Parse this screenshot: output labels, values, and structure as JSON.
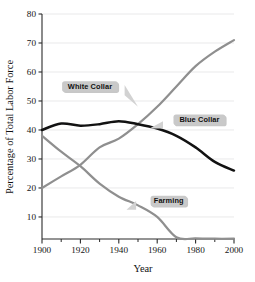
{
  "chart_data": {
    "type": "line",
    "title": "",
    "xlabel": "Year",
    "ylabel": "Percentage of Total Labor Force",
    "xlim": [
      1900,
      2000
    ],
    "ylim": [
      2.4,
      80
    ],
    "grid": true,
    "legend_position": "inline-callouts",
    "xticks": [
      1900,
      1920,
      1940,
      1960,
      1980,
      2000
    ],
    "xtick_labels": [
      "1900",
      "1920",
      "1940",
      "1960",
      "1980",
      "2000"
    ],
    "xminor_ticks": [
      1910,
      1930,
      1950,
      1970,
      1990
    ],
    "yticks": [
      10,
      20,
      30,
      40,
      50,
      60,
      70,
      80
    ],
    "ytick_labels": [
      "10",
      "20",
      "30",
      "40",
      "50",
      "60",
      "70",
      "80"
    ],
    "x": [
      1900,
      1910,
      1920,
      1930,
      1940,
      1950,
      1960,
      1970,
      1980,
      1990,
      2000
    ],
    "series": [
      {
        "name": "White Collar",
        "color": "#8f8f8f",
        "values": [
          20,
          24,
          28,
          34,
          37,
          42,
          48,
          55,
          62,
          67,
          71
        ]
      },
      {
        "name": "Blue Collar",
        "color": "#121212",
        "values": [
          40,
          42.2,
          41.5,
          42,
          43,
          42,
          40.5,
          38,
          34,
          29,
          26
        ]
      },
      {
        "name": "Farming",
        "color": "#8f8f8f",
        "values": [
          38,
          32.5,
          27.5,
          21.5,
          17,
          14,
          10,
          3,
          2.6,
          2.5,
          2.5
        ]
      }
    ],
    "annotations": [
      {
        "label": "White Collar",
        "x": 1925,
        "y": 55
      },
      {
        "label": "Blue Collar",
        "x": 1982,
        "y": 43.5
      },
      {
        "label": "Farming",
        "x": 1966,
        "y": 15.5
      }
    ]
  },
  "axes": {
    "x_axis_title": "Year",
    "y_axis_title": "Percentage of Total Labor Force"
  },
  "colors": {
    "blue_collar": "#121212",
    "white_collar": "#8f8f8f",
    "farming": "#8f8f8f",
    "gridline": "#e9e9ea",
    "axis": "#2b2b2b",
    "callout_fill": "#c9c9c9",
    "background": "#ffffff"
  }
}
